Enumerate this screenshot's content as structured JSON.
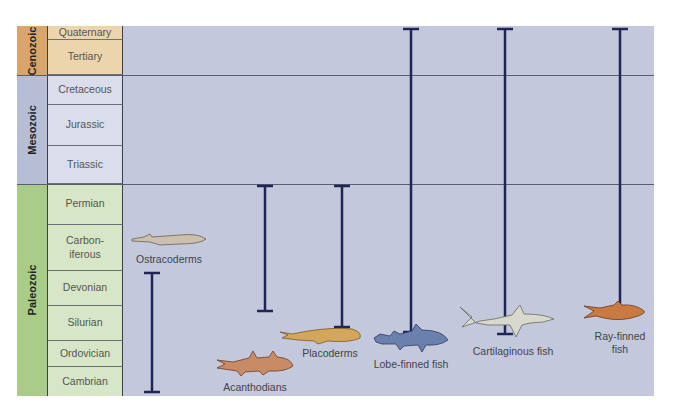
{
  "eras": [
    {
      "name": "Cenozoic",
      "color": "#d9a56a",
      "periods_color": "#ecd4ac"
    },
    {
      "name": "Mesozoic",
      "color": "#b8bdd6",
      "periods_color": "#dadeec"
    },
    {
      "name": "Paleozoic",
      "color": "#a9cc88",
      "periods_color": "#d6e6c6"
    }
  ],
  "periods": [
    {
      "name": "Quaternary",
      "era": "Cenozoic"
    },
    {
      "name": "Tertiary",
      "era": "Cenozoic"
    },
    {
      "name": "Cretaceous",
      "era": "Mesozoic"
    },
    {
      "name": "Jurassic",
      "era": "Mesozoic"
    },
    {
      "name": "Triassic",
      "era": "Mesozoic"
    },
    {
      "name": "Permian",
      "era": "Paleozoic"
    },
    {
      "name": "Carbon-\niferous",
      "era": "Paleozoic"
    },
    {
      "name": "Devonian",
      "era": "Paleozoic"
    },
    {
      "name": "Silurian",
      "era": "Paleozoic"
    },
    {
      "name": "Ordovician",
      "era": "Paleozoic"
    },
    {
      "name": "Cambrian",
      "era": "Paleozoic"
    }
  ],
  "groups": [
    {
      "name": "Ostracoderms",
      "from": "Cambrian",
      "to": "Devonian",
      "fish_color": "#cdbfae"
    },
    {
      "name": "Acanthodians",
      "from": "Silurian",
      "to": "Permian",
      "fish_color": "#c98a66"
    },
    {
      "name": "Placoderms",
      "from": "Silurian",
      "to": "Permian",
      "fish_color": "#d3a65c"
    },
    {
      "name": "Lobe-finned fish",
      "from": "Silurian",
      "to": "Quaternary",
      "fish_color": "#6c80ad"
    },
    {
      "name": "Cartilaginous fish",
      "from": "Silurian",
      "to": "Quaternary",
      "fish_color": "#d8d8cc"
    },
    {
      "name": "Ray-finned\nfish",
      "from": "Silurian",
      "to": "Quaternary",
      "fish_color": "#c97a43"
    }
  ],
  "bar_color": "#1f2555"
}
